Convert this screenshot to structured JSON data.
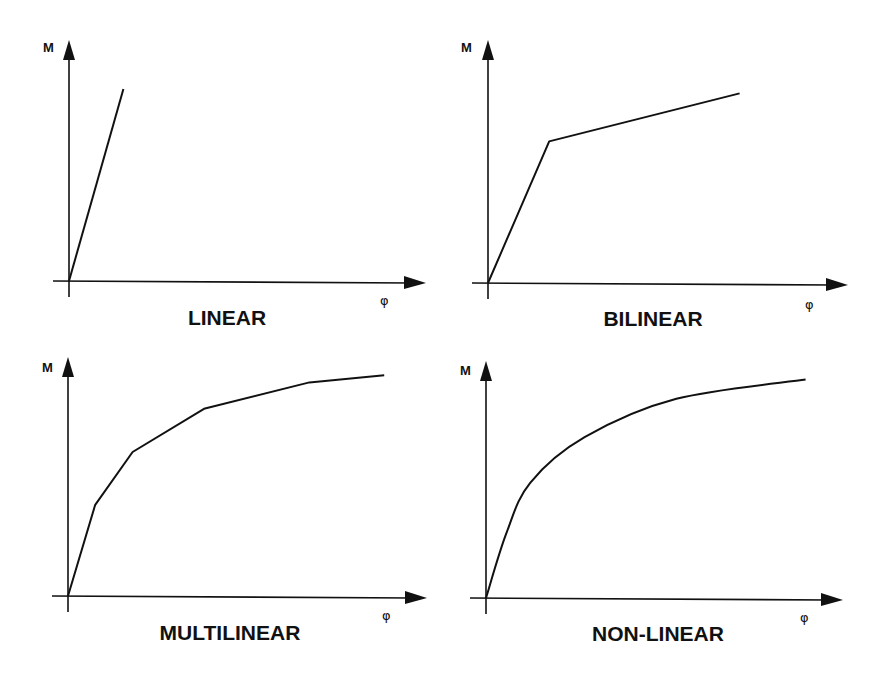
{
  "chart_data": [
    {
      "type": "line",
      "title": "LINEAR",
      "xlabel": "φ",
      "ylabel": "M",
      "xlim": [
        0,
        10
      ],
      "ylim": [
        0,
        10
      ],
      "grid": false,
      "series": [
        {
          "name": "M-φ",
          "x": [
            0,
            1.6
          ],
          "y": [
            0,
            8.0
          ]
        }
      ]
    },
    {
      "type": "line",
      "title": "BILINEAR",
      "xlabel": "φ",
      "ylabel": "M",
      "xlim": [
        0,
        10
      ],
      "ylim": [
        0,
        10
      ],
      "grid": false,
      "series": [
        {
          "name": "M-φ",
          "x": [
            0,
            1.8,
            7.4
          ],
          "y": [
            0,
            5.9,
            7.9
          ]
        }
      ]
    },
    {
      "type": "line",
      "title": "MULTILINEAR",
      "xlabel": "φ",
      "ylabel": "M",
      "xlim": [
        0,
        10
      ],
      "ylim": [
        0,
        10
      ],
      "grid": false,
      "series": [
        {
          "name": "M-φ",
          "x": [
            0,
            0.8,
            1.9,
            4.0,
            7.1,
            9.3
          ],
          "y": [
            0,
            3.8,
            6.0,
            7.8,
            8.9,
            9.2
          ]
        }
      ]
    },
    {
      "type": "line",
      "title": "NON-LINEAR",
      "xlabel": "φ",
      "ylabel": "M",
      "xlim": [
        0,
        10
      ],
      "ylim": [
        0,
        10
      ],
      "grid": false,
      "curve": "smooth",
      "series": [
        {
          "name": "M-φ",
          "x": [
            0,
            0.6,
            1.3,
            2.9,
            5.6,
            9.4
          ],
          "y": [
            0,
            2.7,
            4.8,
            6.7,
            8.3,
            9.1
          ]
        }
      ]
    }
  ]
}
